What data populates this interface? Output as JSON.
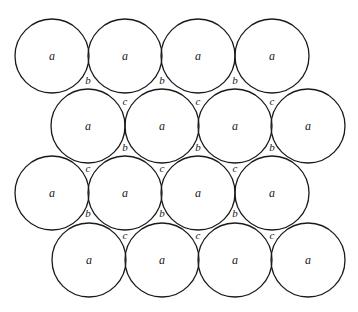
{
  "diagram": {
    "radius": 37,
    "circles": [
      {
        "cx": 52,
        "cy": 56,
        "label": "a"
      },
      {
        "cx": 125,
        "cy": 56,
        "label": "a"
      },
      {
        "cx": 198,
        "cy": 56,
        "label": "a"
      },
      {
        "cx": 272,
        "cy": 56,
        "label": "a"
      },
      {
        "cx": 88,
        "cy": 126,
        "label": "a"
      },
      {
        "cx": 162,
        "cy": 126,
        "label": "a"
      },
      {
        "cx": 235,
        "cy": 126,
        "label": "a"
      },
      {
        "cx": 308,
        "cy": 126,
        "label": "a"
      },
      {
        "cx": 52,
        "cy": 193,
        "label": "a"
      },
      {
        "cx": 125,
        "cy": 193,
        "label": "a"
      },
      {
        "cx": 198,
        "cy": 193,
        "label": "a"
      },
      {
        "cx": 272,
        "cy": 193,
        "label": "a"
      },
      {
        "cx": 89,
        "cy": 260,
        "label": "a"
      },
      {
        "cx": 162,
        "cy": 260,
        "label": "a"
      },
      {
        "cx": 235,
        "cy": 260,
        "label": "a"
      },
      {
        "cx": 308,
        "cy": 260,
        "label": "a"
      }
    ],
    "gap_labels": [
      {
        "x": 88,
        "y": 80,
        "label": "b"
      },
      {
        "x": 162,
        "y": 80,
        "label": "b"
      },
      {
        "x": 235,
        "y": 80,
        "label": "b"
      },
      {
        "x": 125,
        "y": 101,
        "label": "c"
      },
      {
        "x": 198,
        "y": 101,
        "label": "c"
      },
      {
        "x": 272,
        "y": 101,
        "label": "c"
      },
      {
        "x": 125,
        "y": 147,
        "label": "b"
      },
      {
        "x": 198,
        "y": 147,
        "label": "b"
      },
      {
        "x": 272,
        "y": 147,
        "label": "b"
      },
      {
        "x": 88,
        "y": 168,
        "label": "c"
      },
      {
        "x": 162,
        "y": 168,
        "label": "c"
      },
      {
        "x": 235,
        "y": 168,
        "label": "c"
      },
      {
        "x": 88,
        "y": 213,
        "label": "b"
      },
      {
        "x": 162,
        "y": 213,
        "label": "b"
      },
      {
        "x": 235,
        "y": 213,
        "label": "b"
      },
      {
        "x": 125,
        "y": 235,
        "label": "c"
      },
      {
        "x": 198,
        "y": 235,
        "label": "c"
      },
      {
        "x": 272,
        "y": 235,
        "label": "c"
      }
    ]
  }
}
